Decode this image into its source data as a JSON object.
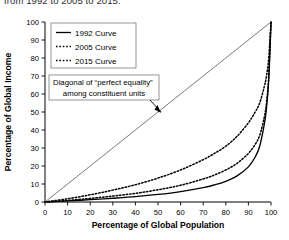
{
  "caption": {
    "text": "from 1992 to 2005 to 2015."
  },
  "chart_data": {
    "type": "line",
    "title": "",
    "xlabel": "Percentage of Global Population",
    "ylabel": "Percentage of Global Income",
    "xlim": [
      0,
      100
    ],
    "ylim": [
      0,
      100
    ],
    "xticks": [
      0,
      10,
      20,
      30,
      40,
      50,
      60,
      70,
      80,
      90,
      100
    ],
    "yticks": [
      0,
      10,
      20,
      30,
      40,
      50,
      60,
      70,
      80,
      90,
      100
    ],
    "grid": false,
    "legend_position": "top-left",
    "series": [
      {
        "name": "1992 Curve",
        "style": "solid",
        "color": "#000000",
        "x": [
          0,
          10,
          20,
          30,
          40,
          50,
          60,
          70,
          75,
          80,
          85,
          90,
          93,
          95,
          97,
          98,
          99,
          100
        ],
        "y": [
          0,
          0.6,
          1.3,
          2.1,
          3.0,
          4.2,
          5.8,
          8.0,
          9.5,
          11.5,
          14.5,
          19.5,
          25.0,
          31.0,
          43.0,
          52.0,
          68.0,
          100
        ]
      },
      {
        "name": "2005 Curve",
        "style": "dotted",
        "color": "#000000",
        "x": [
          0,
          10,
          20,
          30,
          40,
          50,
          60,
          70,
          75,
          80,
          85,
          90,
          93,
          95,
          97,
          98,
          99,
          100
        ],
        "y": [
          0,
          0.9,
          2.0,
          3.3,
          4.8,
          6.8,
          9.3,
          12.8,
          15.0,
          17.8,
          21.5,
          27.0,
          32.0,
          37.0,
          47.0,
          55.0,
          70.0,
          100
        ]
      },
      {
        "name": "2015 Curve",
        "style": "dotted",
        "color": "#000000",
        "x": [
          0,
          10,
          20,
          30,
          40,
          50,
          60,
          70,
          75,
          80,
          85,
          90,
          93,
          95,
          97,
          98,
          99,
          100
        ],
        "y": [
          0,
          1.8,
          4.0,
          6.6,
          9.6,
          13.3,
          17.8,
          23.5,
          27.0,
          31.0,
          36.5,
          44.0,
          50.0,
          55.0,
          64.0,
          70.0,
          80.0,
          100
        ]
      },
      {
        "name": "Diagonal of perfect equality",
        "style": "solid-thin",
        "color": "#555555",
        "x": [
          0,
          100
        ],
        "y": [
          0,
          100
        ]
      }
    ],
    "legend": [
      {
        "label": "1992 Curve",
        "style": "solid"
      },
      {
        "label": "2005 Curve",
        "style": "dotted"
      },
      {
        "label": "2015 Curve",
        "style": "dotted"
      }
    ],
    "annotation": {
      "line1": "Diagonal of “perfect equality”",
      "line2": "among constituent units"
    }
  }
}
